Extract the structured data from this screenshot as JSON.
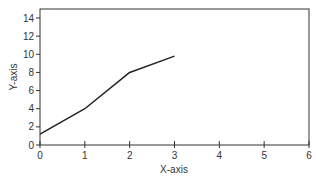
{
  "chart_data": {
    "type": "line",
    "title": "",
    "xlabel": "X-axis",
    "ylabel": "Y-axis",
    "xlim": [
      0,
      6
    ],
    "ylim": [
      0,
      14
    ],
    "x_ticks": [
      0,
      1,
      2,
      3,
      4,
      5,
      6
    ],
    "y_ticks": [
      0,
      2,
      4,
      6,
      8,
      10,
      12,
      14
    ],
    "grid": false,
    "legend": null,
    "series": [
      {
        "name": "series-1",
        "x": [
          0,
          1,
          2,
          3
        ],
        "y": [
          1.2,
          4,
          8,
          9.8
        ],
        "color": "#222222"
      }
    ]
  },
  "colors": {
    "axis": "#333333",
    "line": "#222222",
    "background": "#ffffff"
  }
}
